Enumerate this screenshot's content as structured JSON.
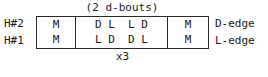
{
  "figure": {
    "top_caption": "(2 d-bouts)",
    "bottom_caption": "x3",
    "row_left_labels": [
      "H#2",
      "H#1"
    ],
    "row_right_labels": [
      "D-edge",
      "L-edge"
    ],
    "rows": [
      {
        "left_label": "H#2",
        "right_label": "D-edge",
        "cells": [
          "M",
          "D L  L D",
          "M"
        ]
      },
      {
        "left_label": "H#1",
        "right_label": "L-edge",
        "cells": [
          "M",
          "L D  D L",
          "M"
        ]
      }
    ],
    "colors": {
      "ink": "#1a1a1a",
      "rule": "#2a2a2a",
      "background": "#ffffff"
    }
  }
}
